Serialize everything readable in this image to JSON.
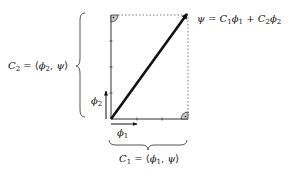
{
  "diagram": {
    "colors": {
      "stroke": "#111111",
      "axis": "#333333",
      "dotted": "#555555",
      "marker_fill": "#bbbbbb"
    },
    "psi_label": {
      "psi": "ψ",
      "eq": " = ",
      "c": "C",
      "c1_sub": "1",
      "phi": "ϕ",
      "phi1_sub": "1",
      "plus": " + ",
      "c2_sub": "2",
      "phi2_sub": "2"
    },
    "c2_label": {
      "c": "C",
      "sub": "2",
      "eq": " = ⟨",
      "phi": "ϕ",
      "phi_sub": "2",
      "comma": ", ",
      "psi": "ψ",
      "close": "⟩"
    },
    "c1_label": {
      "c": "C",
      "sub": "1",
      "eq": " = ⟨",
      "phi": "ϕ",
      "phi_sub": "1",
      "comma": ", ",
      "psi": "ψ",
      "close": "⟩"
    },
    "phi1_label": {
      "phi": "ϕ",
      "sub": "1"
    },
    "phi2_label": {
      "phi": "ϕ",
      "sub": "2"
    }
  }
}
